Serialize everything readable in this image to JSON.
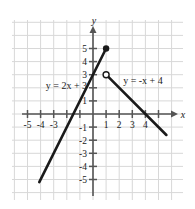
{
  "figure": {
    "type": "graph",
    "background_color": "#ffffff",
    "grid_color": "#d8d8d8",
    "axis_color": "#555555",
    "curve_color": "#1a1a1a"
  },
  "axes": {
    "x_axis_name": "x",
    "y_axis_name": "y",
    "x_tick_labels": [
      "-5",
      "-4",
      "-3",
      "1",
      "2",
      "3",
      "4"
    ],
    "x_tick_values": [
      -5,
      -4,
      -3,
      1,
      2,
      3,
      4
    ],
    "y_tick_labels": [
      "5",
      "4",
      "3",
      "1",
      "-1",
      "-2",
      "-3",
      "-4",
      "-5"
    ],
    "y_tick_values": [
      5,
      4,
      3,
      1,
      -1,
      -2,
      -3,
      -4,
      -5
    ],
    "xlim": [
      -5.8,
      6.0
    ],
    "ylim": [
      -5.8,
      6.2
    ]
  },
  "labels": {
    "left_equation": "y = 2x + 3",
    "right_equation": "y = -x + 4"
  },
  "chart_data": {
    "type": "line",
    "title": "",
    "xlabel": "x",
    "ylabel": "y",
    "xlim": [
      -5.8,
      6.0
    ],
    "ylim": [
      -5.8,
      6.2
    ],
    "grid": true,
    "legend": "none",
    "series": [
      {
        "name": "y = 2x + 3",
        "equation": "y = 2x + 3",
        "slope": 2,
        "intercept": 3,
        "x_start": -4.1,
        "y_start": -5.2,
        "x_end": 1,
        "y_end": 5,
        "endpoint_start_marker": "none",
        "endpoint_end_marker": "closed-circle",
        "label_position": [
          -3.6,
          1.9
        ]
      },
      {
        "name": "y = -x + 4",
        "equation": "y = -x + 4",
        "slope": -1,
        "intercept": 4,
        "x_start": 1,
        "y_start": 3,
        "x_end": 5.6,
        "y_end": -1.6,
        "endpoint_start_marker": "open-circle",
        "endpoint_end_marker": "none",
        "label_position": [
          2.3,
          2.3
        ]
      }
    ],
    "annotations": [
      {
        "text": "y = 2x + 3",
        "x": -3.6,
        "y": 1.9
      },
      {
        "text": "y = -x + 4",
        "x": 2.3,
        "y": 2.3
      }
    ]
  }
}
